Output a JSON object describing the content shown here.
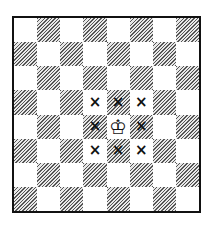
{
  "board": {
    "files": [
      "a",
      "b",
      "c",
      "d",
      "e",
      "f",
      "g",
      "h"
    ],
    "ranks": [
      "8",
      "7",
      "6",
      "5",
      "4",
      "3",
      "2",
      "1"
    ],
    "top_left_color": "light",
    "pieces": [
      {
        "square": "e4",
        "piece": "white-king",
        "glyph": "♔"
      }
    ],
    "marks": [
      {
        "square": "d5",
        "glyph": "×"
      },
      {
        "square": "e5",
        "glyph": "×"
      },
      {
        "square": "f5",
        "glyph": "×"
      },
      {
        "square": "d4",
        "glyph": "×"
      },
      {
        "square": "f4",
        "glyph": "×"
      },
      {
        "square": "d3",
        "glyph": "×"
      },
      {
        "square": "e3",
        "glyph": "×"
      },
      {
        "square": "f3",
        "glyph": "×"
      }
    ]
  }
}
